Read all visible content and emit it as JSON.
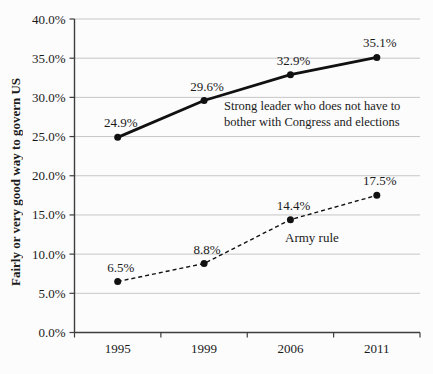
{
  "colors": {
    "background": "#fcfcfc",
    "grid": "#c6c6c6",
    "axis": "#3d3d3d",
    "line": "#111111",
    "text": "#1a1a1a"
  },
  "chart_data": {
    "type": "line",
    "title": "",
    "xlabel": "",
    "ylabel": "Fairly or very good way to govern US",
    "categories": [
      "1995",
      "1999",
      "2006",
      "2011"
    ],
    "series": [
      {
        "name": "Strong leader who does not have to bother with Congress and elections",
        "style": "solid",
        "values": [
          24.9,
          29.6,
          32.9,
          35.1
        ],
        "labels": [
          "24.9%",
          "29.6%",
          "32.9%",
          "35.1%"
        ]
      },
      {
        "name": "Army rule",
        "style": "dashed",
        "values": [
          6.5,
          8.8,
          14.4,
          17.5
        ],
        "labels": [
          "6.5%",
          "8.8%",
          "14.4%",
          "17.5%"
        ]
      }
    ],
    "ylim": [
      0,
      40
    ],
    "ytick_step": 5,
    "yticks": [
      {
        "v": 0,
        "label": "0.0%"
      },
      {
        "v": 5,
        "label": "5.0%"
      },
      {
        "v": 10,
        "label": "10.0%"
      },
      {
        "v": 15,
        "label": "15.0%"
      },
      {
        "v": 20,
        "label": "20.0%"
      },
      {
        "v": 25,
        "label": "25.0%"
      },
      {
        "v": 30,
        "label": "30.0%"
      },
      {
        "v": 35,
        "label": "35.0%"
      },
      {
        "v": 40,
        "label": "40.0%"
      }
    ],
    "grid": true,
    "legend": "inline-annotations",
    "annotations": [
      {
        "series": 0,
        "lines": [
          "Strong leader who does not have to",
          "bother with Congress and elections"
        ]
      },
      {
        "series": 1,
        "lines": [
          "Army rule"
        ]
      }
    ]
  }
}
